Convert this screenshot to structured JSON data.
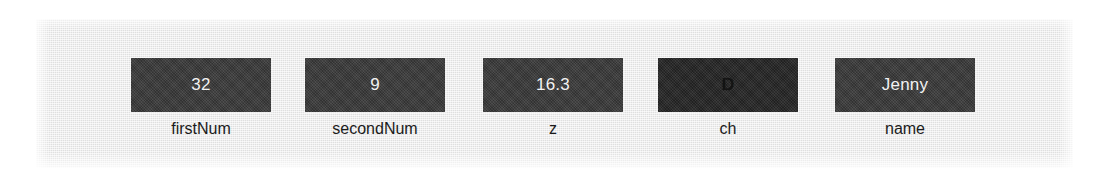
{
  "figure": {
    "background_color": "#ffffff",
    "panel_color": "#e9e9e9",
    "box_color": "#3b3b3b",
    "box_color_dark": "#262626",
    "value_text_color": "#f2f2f2",
    "label_text_color": "#1b1b1b"
  },
  "variables": [
    {
      "value": "32",
      "label": "firstNum",
      "style": "normal"
    },
    {
      "value": "9",
      "label": "secondNum",
      "style": "normal"
    },
    {
      "value": "16.3",
      "label": "z",
      "style": "normal"
    },
    {
      "value": "D",
      "label": "ch",
      "style": "dark"
    },
    {
      "value": "Jenny",
      "label": "name",
      "style": "normal"
    }
  ]
}
